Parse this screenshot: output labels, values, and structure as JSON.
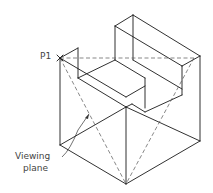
{
  "diagram": {
    "type": "isometric-technical-drawing",
    "labels": {
      "point": "P1",
      "viewing_plane_line1": "Viewing",
      "viewing_plane_line2": "plane"
    },
    "colors": {
      "line": "#1a1a1a",
      "hidden_line": "#555555",
      "label": "#444444",
      "background": "#ffffff"
    }
  }
}
